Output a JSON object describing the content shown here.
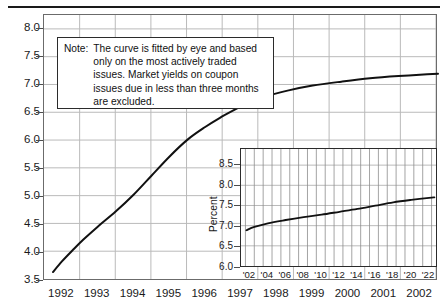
{
  "chart_data": [
    {
      "id": "main",
      "type": "line",
      "title": "",
      "xlabel": "",
      "ylabel": "Percent",
      "xlim": [
        1991.5,
        2002.5
      ],
      "ylim": [
        3.5,
        8.25
      ],
      "ytick_labels": [
        "8.0",
        "7.5",
        "7.0",
        "6.5",
        "6.0",
        "5.5",
        "5.0",
        "4.5",
        "4.0",
        "3.5"
      ],
      "ytick_values": [
        8.0,
        7.5,
        7.0,
        6.5,
        6.0,
        5.5,
        5.0,
        4.5,
        4.0,
        3.5
      ],
      "xtick_labels": [
        "1992",
        "1993",
        "1994",
        "1995",
        "1996",
        "1997",
        "1998",
        "1999",
        "2000",
        "2001",
        "2002"
      ],
      "xtick_values": [
        1992,
        1993,
        1994,
        1995,
        1996,
        1997,
        1998,
        1999,
        2000,
        2001,
        2002
      ],
      "grid": true,
      "legend": "none",
      "series": [
        {
          "name": "Treasury yield curve (fitted by eye)",
          "x": [
            1991.75,
            1992.0,
            1992.3,
            1992.6,
            1993.0,
            1993.5,
            1994.0,
            1994.5,
            1995.0,
            1995.5,
            1996.0,
            1996.4,
            1996.8,
            1997.2,
            1997.7,
            1998.3,
            1999.0,
            1999.8,
            2000.6,
            2001.4,
            2002.2,
            2002.5
          ],
          "y": [
            3.66,
            3.85,
            4.05,
            4.24,
            4.47,
            4.74,
            5.04,
            5.38,
            5.72,
            6.02,
            6.25,
            6.41,
            6.55,
            6.68,
            6.8,
            6.9,
            6.99,
            7.06,
            7.12,
            7.16,
            7.19,
            7.2
          ]
        }
      ]
    },
    {
      "id": "inset",
      "type": "line",
      "title": "",
      "xlabel": "",
      "ylabel": "Percent",
      "xlim": [
        2001,
        2023
      ],
      "ylim": [
        6.0,
        8.9
      ],
      "ytick_labels": [
        "8.5",
        "8.0",
        "7.5",
        "7.0",
        "6.5",
        "6.0"
      ],
      "ytick_values": [
        8.5,
        8.0,
        7.5,
        7.0,
        6.5,
        6.0
      ],
      "xtick_labels": [
        "'02",
        "'04",
        "'06",
        "'08",
        "'10",
        "'12",
        "'14",
        "'16",
        "'18",
        "'20",
        "'22"
      ],
      "xtick_values": [
        2002,
        2004,
        2006,
        2008,
        2010,
        2012,
        2014,
        2016,
        2018,
        2020,
        2022
      ],
      "grid": true,
      "legend": "none",
      "series": [
        {
          "name": "Treasury yield curve (long maturities)",
          "x": [
            2001.6,
            2002.5,
            2004,
            2006,
            2008,
            2010,
            2012,
            2014,
            2016,
            2018,
            2020,
            2022,
            2022.6
          ],
          "y": [
            6.92,
            7.0,
            7.09,
            7.17,
            7.24,
            7.3,
            7.37,
            7.44,
            7.52,
            7.6,
            7.66,
            7.71,
            7.72
          ]
        }
      ]
    }
  ],
  "note": {
    "label": "Note:",
    "lines": [
      "The curve is fitted by eye and based",
      "only on the most actively traded",
      "issues.  Market yields on coupon",
      "issues due in less than three months",
      "are excluded."
    ]
  },
  "colors": {
    "curve": "#111111",
    "grid": "#b9b9b9",
    "axis": "#6b6b6b",
    "text": "#1a1a1a",
    "rule": "#1a1a1a"
  }
}
